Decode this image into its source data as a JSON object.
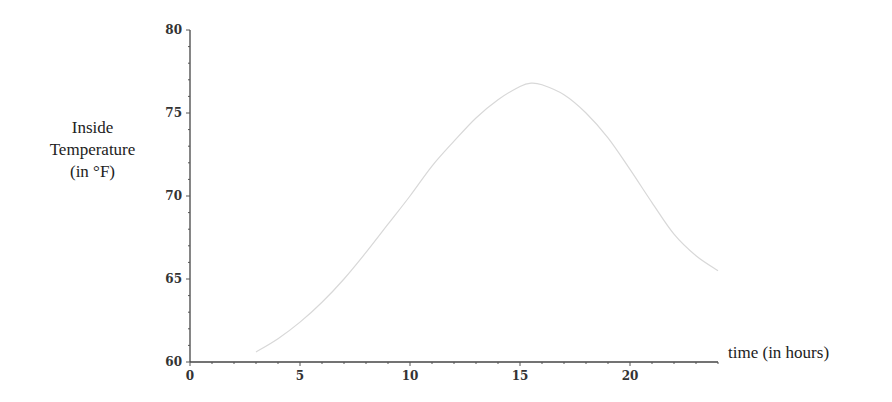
{
  "chart_data": {
    "type": "line",
    "title": "",
    "xlabel": "time (in hours)",
    "ylabel": [
      "Inside",
      "Temperature",
      "(in °F)"
    ],
    "xlim": [
      0,
      24
    ],
    "ylim": [
      60,
      80
    ],
    "x_ticks": [
      "0",
      "5",
      "10",
      "15",
      "20"
    ],
    "y_ticks": [
      "60",
      "65",
      "70",
      "75",
      "80"
    ],
    "grid": false,
    "legend": null,
    "series": [
      {
        "name": "Inside Temperature",
        "color": "#d8d8d8",
        "x": [
          3,
          4,
          5,
          6,
          7,
          8,
          9,
          10,
          11,
          12,
          13,
          14,
          15,
          15.5,
          16,
          17,
          18,
          19,
          20,
          21,
          22,
          23,
          24
        ],
        "values": [
          60.6,
          61.4,
          62.4,
          63.6,
          65.0,
          66.6,
          68.3,
          70.0,
          71.8,
          73.3,
          74.7,
          75.8,
          76.6,
          76.8,
          76.7,
          76.1,
          75.0,
          73.5,
          71.6,
          69.6,
          67.7,
          66.4,
          65.5
        ]
      }
    ]
  }
}
